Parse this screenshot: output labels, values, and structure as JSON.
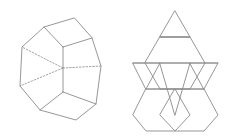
{
  "figure": {
    "title": "Truncated tetrahedron and its net",
    "background_color": "#ffffff",
    "stroke_color": "#8a8a8a",
    "hidden_stroke_color": "#9a9a9a",
    "stroke_width": 0.9,
    "hidden_dash_pattern": "1.6 1.7"
  },
  "chart_data": {
    "type": "diagram",
    "title": "Truncated tetrahedron and its net",
    "panels": [
      {
        "name": "solid-view",
        "label": "Truncated tetrahedron (perspective view)",
        "projection": "oblique",
        "visible_vertices": [
          {
            "id": "A",
            "x": 74,
            "y": 18
          },
          {
            "id": "B",
            "x": 44,
            "y": 27
          },
          {
            "id": "C",
            "x": 22,
            "y": 47
          },
          {
            "id": "D",
            "x": 20,
            "y": 86
          },
          {
            "id": "E",
            "x": 40,
            "y": 110
          },
          {
            "id": "F",
            "x": 76,
            "y": 120
          },
          {
            "id": "G",
            "x": 96,
            "y": 104
          },
          {
            "id": "H",
            "x": 101,
            "y": 66
          },
          {
            "id": "I",
            "x": 92,
            "y": 38
          },
          {
            "id": "J",
            "x": 63,
            "y": 47
          },
          {
            "id": "K",
            "x": 63,
            "y": 92
          },
          {
            "id": "L",
            "x": 63,
            "y": 68
          }
        ],
        "solid_edges": [
          [
            "A",
            "B"
          ],
          [
            "B",
            "C"
          ],
          [
            "C",
            "D"
          ],
          [
            "D",
            "E"
          ],
          [
            "E",
            "F"
          ],
          [
            "F",
            "G"
          ],
          [
            "G",
            "H"
          ],
          [
            "H",
            "I"
          ],
          [
            "I",
            "A"
          ],
          [
            "B",
            "J"
          ],
          [
            "I",
            "J"
          ],
          [
            "J",
            "K"
          ],
          [
            "E",
            "K"
          ],
          [
            "G",
            "K"
          ]
        ],
        "hidden_edges": [
          [
            "L",
            "C"
          ],
          [
            "L",
            "D"
          ],
          [
            "L",
            "H"
          ]
        ]
      },
      {
        "name": "net-view",
        "label": "Net of the truncated tetrahedron",
        "face_counts": {
          "hexagons": 4,
          "triangles": 4
        },
        "faces": [
          {
            "shape": "triangle",
            "position": "top",
            "orientation": "up",
            "points": "175,11 190,37 160,37"
          },
          {
            "shape": "hexagon",
            "position": "upper-middle",
            "points": "160,37 190,37 205,63 190,89 160,89 145,63"
          },
          {
            "shape": "triangle",
            "position": "middle-left",
            "orientation": "down",
            "points": "133,63 160,63 146,89"
          },
          {
            "shape": "triangle",
            "position": "middle-right",
            "orientation": "down",
            "points": "190,63 218,63 204,89"
          },
          {
            "shape": "triangle",
            "position": "lower-center",
            "orientation": "down",
            "points": "160,63 190,63 175,115"
          },
          {
            "shape": "hexagon",
            "position": "bottom-left",
            "points": "146,89 175,89 190,115 175,131 146,131 133,115"
          },
          {
            "shape": "hexagon",
            "position": "bottom-right",
            "points": "175,89 204,89 218,115 204,131 175,131 160,115"
          }
        ],
        "net_edges": [
          {
            "from": [
              175,
              11
            ],
            "to": [
              190,
              37
            ]
          },
          {
            "from": [
              190,
              37
            ],
            "to": [
              160,
              37
            ]
          },
          {
            "from": [
              160,
              37
            ],
            "to": [
              175,
              11
            ]
          },
          {
            "from": [
              160,
              37
            ],
            "to": [
              145,
              63
            ]
          },
          {
            "from": [
              145,
              63
            ],
            "to": [
              160,
              89
            ]
          },
          {
            "from": [
              190,
              37
            ],
            "to": [
              205,
              63
            ]
          },
          {
            "from": [
              205,
              63
            ],
            "to": [
              190,
              89
            ]
          },
          {
            "from": [
              133,
              63
            ],
            "to": [
              218,
              63
            ]
          },
          {
            "from": [
              133,
              63
            ],
            "to": [
              160,
              115
            ]
          },
          {
            "from": [
              218,
              63
            ],
            "to": [
              190,
              115
            ]
          },
          {
            "from": [
              160,
              63
            ],
            "to": [
              133,
              115
            ]
          },
          {
            "from": [
              190,
              63
            ],
            "to": [
              218,
              115
            ]
          },
          {
            "from": [
              146,
              89
            ],
            "to": [
              204,
              89
            ]
          },
          {
            "from": [
              133,
              115
            ],
            "to": [
              146,
              131
            ]
          },
          {
            "from": [
              146,
              131
            ],
            "to": [
              204,
              131
            ]
          },
          {
            "from": [
              204,
              131
            ],
            "to": [
              218,
              115
            ]
          },
          {
            "from": [
              133,
              115
            ],
            "to": [
              146,
              89
            ]
          },
          {
            "from": [
              218,
              115
            ],
            "to": [
              204,
              89
            ]
          },
          {
            "from": [
              160,
              115
            ],
            "to": [
              175,
              89
            ]
          },
          {
            "from": [
              190,
              115
            ],
            "to": [
              175,
              89
            ]
          },
          {
            "from": [
              160,
              115
            ],
            "to": [
              175,
              131
            ]
          },
          {
            "from": [
              190,
              115
            ],
            "to": [
              175,
              131
            ]
          }
        ]
      }
    ]
  }
}
